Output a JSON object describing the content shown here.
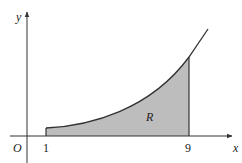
{
  "diagram": {
    "type": "region-under-curve",
    "axes": {
      "x_label": "x",
      "y_label": "y",
      "origin_label": "O"
    },
    "ticks": [
      {
        "label": "1"
      },
      {
        "label": "9"
      }
    ],
    "region_label": "R",
    "colors": {
      "axis": "#333333",
      "curve": "#333333",
      "region_fill": "#bdbdbd"
    }
  }
}
